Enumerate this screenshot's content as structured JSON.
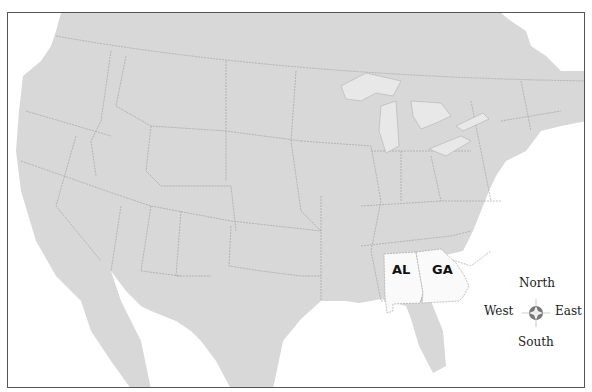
{
  "map": {
    "title": "",
    "region": "Contiguous United States",
    "colors": {
      "land": "#d8d8d8",
      "highlight": "#fafafa",
      "water": "#ffffff",
      "lakes": "#e8e8e8",
      "border": "#9a9a9a",
      "frame": "#555555"
    },
    "highlighted_states": [
      {
        "abbr": "AL",
        "name": "Alabama"
      },
      {
        "abbr": "GA",
        "name": "Georgia"
      }
    ],
    "compass": {
      "north": "North",
      "south": "South",
      "east": "East",
      "west": "West"
    }
  }
}
